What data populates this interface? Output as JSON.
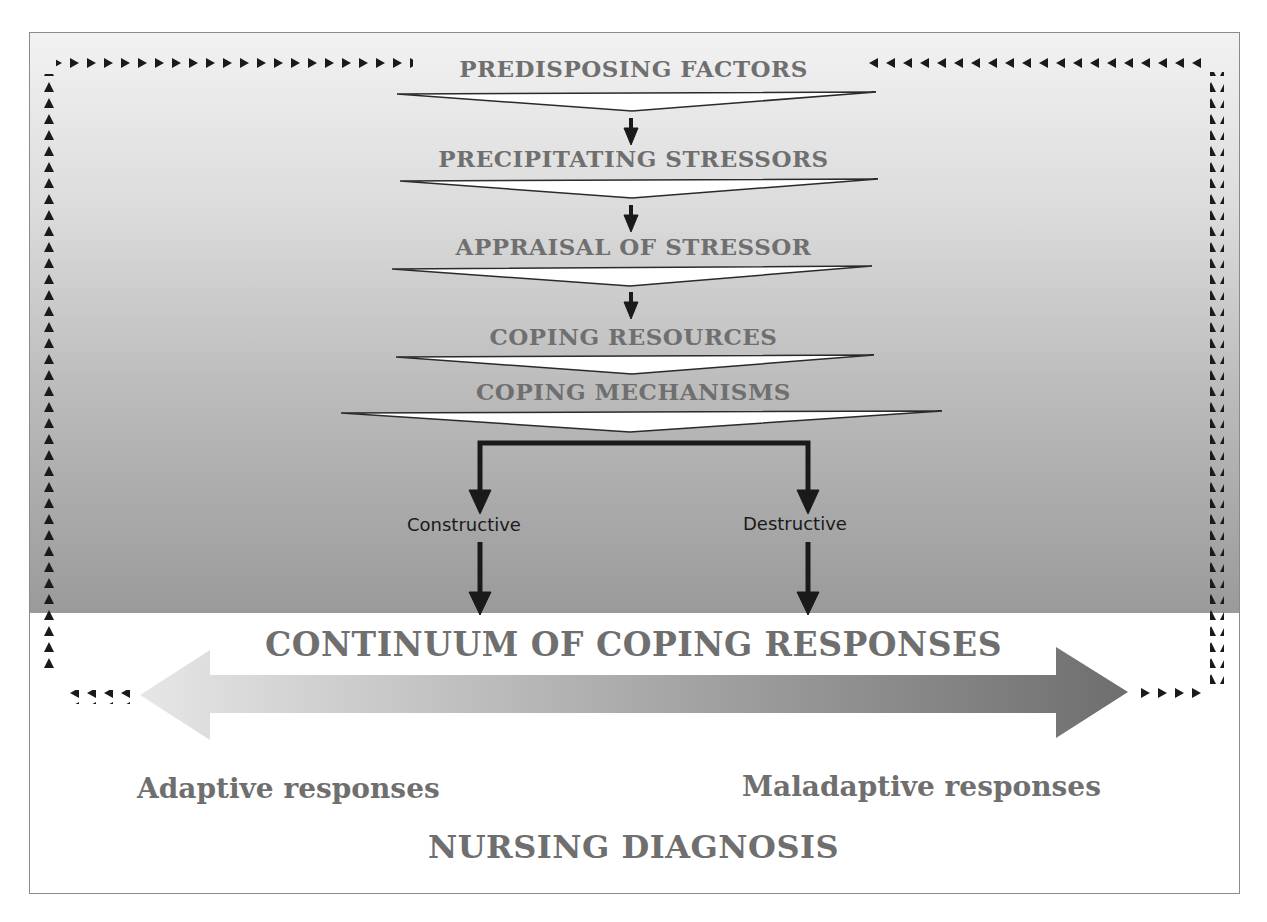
{
  "diagram": {
    "stages": [
      {
        "label": "PREDISPOSING FACTORS"
      },
      {
        "label": "PRECIPITATING STRESSORS"
      },
      {
        "label": "APPRAISAL OF STRESSOR"
      },
      {
        "label": "COPING RESOURCES"
      },
      {
        "label": "COPING MECHANISMS"
      }
    ],
    "branches": {
      "left": "Constructive",
      "right": "Destructive"
    },
    "continuum": {
      "title": "CONTINUUM OF COPING RESPONSES",
      "left_label": "Adaptive responses",
      "right_label": "Maladaptive responses"
    },
    "footer": "NURSING DIAGNOSIS",
    "icons": {
      "feedback_marker": "small-black-triangle",
      "flow_arrow": "down-arrow"
    },
    "colors": {
      "label_gray": "#6f6f6f",
      "arrow_dark": "#1a1a1a",
      "panel_top": "#f2f2f2",
      "panel_bottom": "#9a9a9a"
    }
  }
}
